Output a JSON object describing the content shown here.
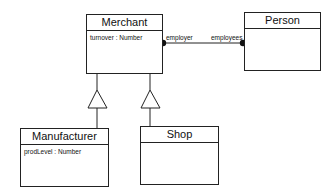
{
  "diagram": {
    "type": "UML class diagram",
    "classes": [
      {
        "id": "merchant",
        "name": "Merchant",
        "attributes": [
          "turnover : Number"
        ]
      },
      {
        "id": "person",
        "name": "Person",
        "attributes": []
      },
      {
        "id": "manufacturer",
        "name": "Manufacturer",
        "attributes": [
          "prodLevel : Number"
        ]
      },
      {
        "id": "shop",
        "name": "Shop",
        "attributes": []
      }
    ],
    "associations": [
      {
        "from": "merchant",
        "to": "person",
        "from_role": "employer",
        "to_role": "employees",
        "ends": "filled-dot"
      }
    ],
    "generalizations": [
      {
        "child": "manufacturer",
        "parent": "merchant"
      },
      {
        "child": "shop",
        "parent": "merchant"
      }
    ]
  }
}
